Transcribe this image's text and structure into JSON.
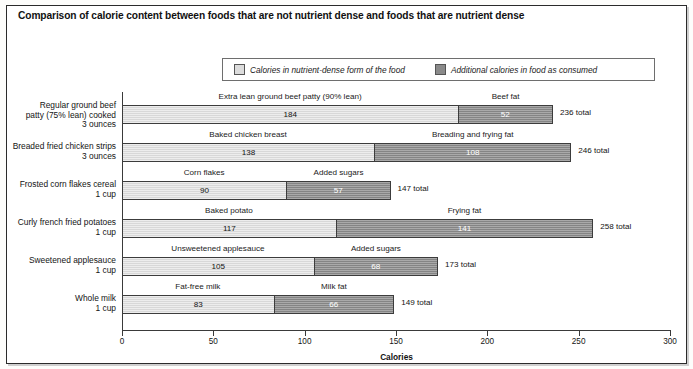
{
  "title": "Comparison of calorie content between foods that are not nutrient dense and foods that are nutrient dense",
  "legend": {
    "light_label": "Calories in nutrient-dense form of the food",
    "dark_label": "Additional calories in food as consumed",
    "light_color": "#dcdcdc",
    "dark_color": "#8a8a8a"
  },
  "axis": {
    "xlabel": "Calories",
    "ticks": [
      0,
      50,
      100,
      150,
      200,
      250,
      300
    ],
    "tick_labels": [
      "0",
      "50",
      "100",
      "150",
      "200",
      "250",
      "300"
    ],
    "xmin": 0,
    "xmax": 300
  },
  "chart_data": {
    "type": "bar",
    "orientation": "horizontal",
    "stacked": true,
    "title": "Comparison of calorie content between foods that are not nutrient dense and foods that are nutrient dense",
    "xlabel": "Calories",
    "ylabel": "",
    "xlim": [
      0,
      300
    ],
    "grid": false,
    "legend_position": "top-center",
    "categories": [
      "Regular ground beef patty (75% lean) cooked 3 ounces",
      "Breaded fried chicken strips 3 ounces",
      "Frosted corn flakes cereal 1 cup",
      "Curly french fried potatoes 1 cup",
      "Sweetened applesauce 1 cup",
      "Whole milk 1 cup"
    ],
    "series": [
      {
        "name": "Calories in nutrient-dense form of the food",
        "values": [
          184,
          138,
          90,
          117,
          105,
          83
        ]
      },
      {
        "name": "Additional calories in food as consumed",
        "values": [
          52,
          108,
          57,
          141,
          68,
          66
        ]
      }
    ],
    "totals": [
      236,
      246,
      147,
      258,
      173,
      149
    ]
  },
  "rows": [
    {
      "category_line1": "Regular ground beef",
      "category_line2": "patty (75% lean) cooked",
      "category_line3": "3 ounces",
      "light_label": "Extra lean ground beef patty (90% lean)",
      "dark_label": "Beef fat",
      "light_value": "184",
      "dark_value": "52",
      "total_label": "236 total"
    },
    {
      "category_line1": "Breaded fried chicken strips",
      "category_line2": "3 ounces",
      "category_line3": "",
      "light_label": "Baked chicken breast",
      "dark_label": "Breading and frying fat",
      "light_value": "138",
      "dark_value": "108",
      "total_label": "246 total"
    },
    {
      "category_line1": "Frosted corn flakes cereal",
      "category_line2": "1 cup",
      "category_line3": "",
      "light_label": "Corn flakes",
      "dark_label": "Added sugars",
      "light_value": "90",
      "dark_value": "57",
      "total_label": "147 total"
    },
    {
      "category_line1": "Curly french fried potatoes",
      "category_line2": "1 cup",
      "category_line3": "",
      "light_label": "Baked potato",
      "dark_label": "Frying fat",
      "light_value": "117",
      "dark_value": "141",
      "total_label": "258 total"
    },
    {
      "category_line1": "Sweetened applesauce",
      "category_line2": "1 cup",
      "category_line3": "",
      "light_label": "Unsweetened applesauce",
      "dark_label": "Added sugars",
      "light_value": "105",
      "dark_value": "68",
      "total_label": "173 total"
    },
    {
      "category_line1": "Whole milk",
      "category_line2": "1 cup",
      "category_line3": "",
      "light_label": "Fat-free milk",
      "dark_label": "Milk fat",
      "light_value": "83",
      "dark_value": "66",
      "total_label": "149 total"
    }
  ]
}
